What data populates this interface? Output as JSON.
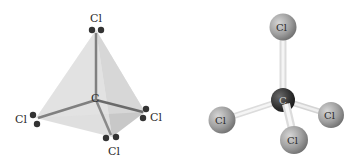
{
  "diagram": {
    "title": "",
    "left_model": {
      "type": "tetrahedral structure with lone pairs",
      "center_atom": "C",
      "outer_atoms": [
        "Cl",
        "Cl",
        "Cl",
        "Cl"
      ]
    },
    "right_model": {
      "type": "ball-and-stick",
      "center_atom": "C",
      "outer_atoms": [
        "Cl",
        "Cl",
        "Cl",
        "Cl"
      ]
    },
    "colors": {
      "face_light": "#d9d9d9",
      "face_dark": "#bdbdbd",
      "bond": "#7a7a7a",
      "lone_pair": "#333333",
      "cl_ball": "#9a9a9a",
      "c_ball": "#3a3a3a",
      "stick": "#e8e8e8"
    }
  }
}
